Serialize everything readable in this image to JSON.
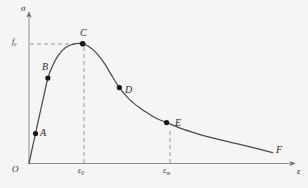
{
  "figure": {
    "background_color": "#f6f5f3",
    "curve_color": "#4a4a4a",
    "axis_color": "#8d8d8d",
    "dash_color": "#8d8d8d",
    "marker_color": "#1a1a1a"
  },
  "axes": {
    "y_label": "σ",
    "x_label": "ε",
    "origin_label": "O"
  },
  "ticks": {
    "y": [
      {
        "label_main": "f",
        "label_sub": "c",
        "value": "fᴄ"
      }
    ],
    "x": [
      {
        "label_main": "ε",
        "label_sub": "0",
        "value": "ε₀"
      },
      {
        "label_main": "ε",
        "label_sub": "m",
        "value": "εₘ"
      }
    ]
  },
  "points": [
    {
      "id": "A",
      "label": "A"
    },
    {
      "id": "B",
      "label": "B"
    },
    {
      "id": "C",
      "label": "C"
    },
    {
      "id": "D",
      "label": "D"
    },
    {
      "id": "E",
      "label": "E"
    },
    {
      "id": "F",
      "label": "F"
    }
  ],
  "chart_data": {
    "type": "line",
    "xlabel": "ε",
    "ylabel": "σ",
    "grid": false,
    "legend": "none",
    "xlim": [
      0,
      1
    ],
    "ylim": [
      0,
      1
    ],
    "axis_ticks": {
      "x": [
        {
          "label": "ε₀",
          "x": 0.205
        },
        {
          "label": "εₘ",
          "x": 0.525
        }
      ],
      "y": [
        {
          "label": "fᴄ",
          "y": 0.82
        }
      ]
    },
    "annotations": [
      {
        "label": "A",
        "x": 0.025,
        "y": 0.205,
        "note": "early ascending branch"
      },
      {
        "label": "B",
        "x": 0.072,
        "y": 0.585,
        "note": "ascending branch"
      },
      {
        "label": "C",
        "x": 0.205,
        "y": 0.82,
        "note": "peak stress fᴄ at strain ε₀"
      },
      {
        "label": "D",
        "x": 0.345,
        "y": 0.52,
        "note": "descending branch inflection"
      },
      {
        "label": "E",
        "x": 0.525,
        "y": 0.28,
        "note": "ultimate strain εₘ"
      },
      {
        "label": "F",
        "x": 0.93,
        "y": 0.075,
        "note": "curve terminus"
      }
    ],
    "series": [
      {
        "name": "stress-strain",
        "x": [
          0.0,
          0.012,
          0.025,
          0.04,
          0.055,
          0.072,
          0.09,
          0.11,
          0.13,
          0.15,
          0.17,
          0.188,
          0.205,
          0.225,
          0.245,
          0.265,
          0.29,
          0.315,
          0.345,
          0.375,
          0.405,
          0.44,
          0.48,
          0.525,
          0.58,
          0.64,
          0.7,
          0.77,
          0.84,
          0.93
        ],
        "y": [
          0.0,
          0.1,
          0.205,
          0.33,
          0.45,
          0.585,
          0.67,
          0.735,
          0.78,
          0.805,
          0.818,
          0.822,
          0.82,
          0.805,
          0.778,
          0.74,
          0.68,
          0.605,
          0.52,
          0.455,
          0.405,
          0.36,
          0.315,
          0.28,
          0.24,
          0.205,
          0.175,
          0.145,
          0.115,
          0.075
        ]
      }
    ]
  }
}
